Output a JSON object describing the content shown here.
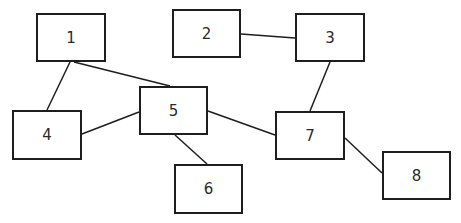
{
  "diagram": {
    "nodes": [
      {
        "id": "1",
        "label": "1",
        "x": 36,
        "y": 13,
        "w": 70,
        "h": 49
      },
      {
        "id": "2",
        "label": "2",
        "x": 172,
        "y": 9,
        "w": 69,
        "h": 49
      },
      {
        "id": "3",
        "label": "3",
        "x": 295,
        "y": 13,
        "w": 70,
        "h": 49
      },
      {
        "id": "4",
        "label": "4",
        "x": 12,
        "y": 110,
        "w": 70,
        "h": 50
      },
      {
        "id": "5",
        "label": "5",
        "x": 139,
        "y": 86,
        "w": 69,
        "h": 49
      },
      {
        "id": "6",
        "label": "6",
        "x": 174,
        "y": 164,
        "w": 69,
        "h": 50
      },
      {
        "id": "7",
        "label": "7",
        "x": 275,
        "y": 111,
        "w": 70,
        "h": 49
      },
      {
        "id": "8",
        "label": "8",
        "x": 382,
        "y": 151,
        "w": 69,
        "h": 49
      }
    ],
    "edges": [
      {
        "from": "1",
        "to": "4",
        "x1": 70,
        "y1": 62,
        "x2": 47,
        "y2": 110
      },
      {
        "from": "1",
        "to": "5",
        "x1": 74,
        "y1": 62,
        "x2": 170,
        "y2": 86
      },
      {
        "from": "2",
        "to": "3",
        "x1": 241,
        "y1": 34,
        "x2": 295,
        "y2": 38
      },
      {
        "from": "3",
        "to": "7",
        "x1": 330,
        "y1": 62,
        "x2": 310,
        "y2": 111
      },
      {
        "from": "4",
        "to": "5",
        "x1": 82,
        "y1": 134,
        "x2": 139,
        "y2": 112
      },
      {
        "from": "5",
        "to": "6",
        "x1": 175,
        "y1": 135,
        "x2": 207,
        "y2": 164
      },
      {
        "from": "5",
        "to": "7",
        "x1": 208,
        "y1": 111,
        "x2": 275,
        "y2": 135
      },
      {
        "from": "7",
        "to": "8",
        "x1": 345,
        "y1": 138,
        "x2": 382,
        "y2": 173
      }
    ],
    "colors": {
      "stroke": "#1e1e1e",
      "text": "#2a2a2a",
      "background": "#ffffff"
    }
  }
}
